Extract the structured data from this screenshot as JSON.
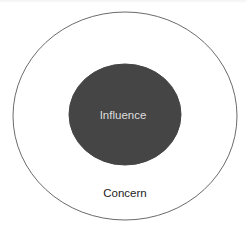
{
  "diagram": {
    "type": "nested-ellipses",
    "outer": {
      "label": "Concern",
      "fill": "#ffffff",
      "stroke": "#6b6b6b",
      "label_color": "#222222",
      "cx": 125,
      "cy": 116,
      "rx": 112,
      "ry": 104
    },
    "inner": {
      "label": "Influence",
      "fill": "#454545",
      "stroke": "#454545",
      "label_color": "#dedede",
      "cx": 125,
      "cy": 114.5,
      "rx": 56,
      "ry": 50.5
    }
  }
}
